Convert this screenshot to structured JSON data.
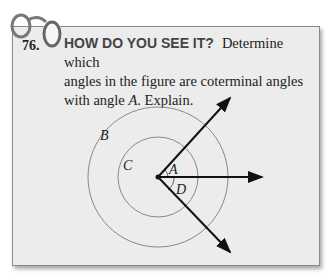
{
  "problem": {
    "number": "76.",
    "heading": "HOW DO YOU SEE IT?",
    "text_line1": "Determine which",
    "text_line2": "angles in the figure are coterminal angles",
    "text_line3_pre": "with angle ",
    "text_line3_var": "A",
    "text_line3_post": ". Explain."
  },
  "figure": {
    "labels": {
      "A": "A",
      "B": "B",
      "C": "C",
      "D": "D"
    }
  }
}
